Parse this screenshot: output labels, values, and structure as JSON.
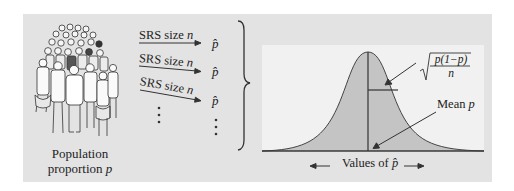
{
  "population": {
    "label_line1": "Population",
    "label_line2": "proportion",
    "label_var": "p",
    "illustration": "crowd-of-people"
  },
  "samples": [
    {
      "label": "SRS size",
      "var": "n",
      "result": "p̂"
    },
    {
      "label": "SRS size",
      "var": "n",
      "result": "p̂"
    },
    {
      "label": "SRS size",
      "var": "n",
      "result": "p̂"
    }
  ],
  "ellipsis": "⋮",
  "distribution": {
    "shape": "normal-curve",
    "sd_formula": {
      "numerator": "p(1−p)",
      "denominator": "n",
      "radical": "√"
    },
    "mean_label": "Mean",
    "mean_var": "p",
    "axis_label": "Values of",
    "axis_var": "p̂",
    "arrow_left": "←",
    "arrow_right": "→"
  },
  "colors": {
    "panel": "#e3e3e3",
    "chart_bg": "#f1f1f1",
    "curve_fill": "#c4c4c4",
    "ink": "#222222"
  }
}
